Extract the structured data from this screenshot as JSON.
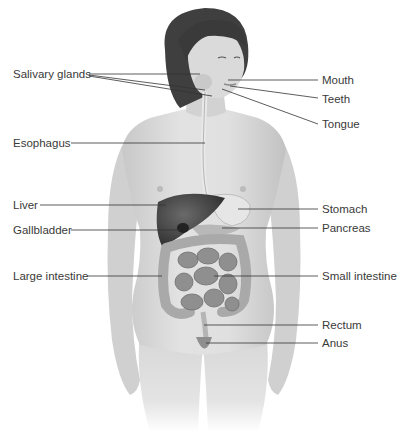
{
  "diagram": {
    "type": "anatomical-illustration",
    "colors": {
      "skin": "#d9d9d9",
      "skin_shadow": "#b5b5b5",
      "hair": "#3f3f3f",
      "liver": "#4a4a4a",
      "intestine": "#9a9a9a",
      "leader_line": "#333333",
      "label_text": "#3a3a3a"
    },
    "labels_left": [
      {
        "id": "salivary-glands",
        "text": "Salivary glands"
      },
      {
        "id": "esophagus",
        "text": "Esophagus"
      },
      {
        "id": "liver",
        "text": "Liver"
      },
      {
        "id": "gallbladder",
        "text": "Gallbladder"
      },
      {
        "id": "large-intestine",
        "text": "Large intestine"
      }
    ],
    "labels_right": [
      {
        "id": "mouth",
        "text": "Mouth"
      },
      {
        "id": "teeth",
        "text": "Teeth"
      },
      {
        "id": "tongue",
        "text": "Tongue"
      },
      {
        "id": "stomach",
        "text": "Stomach"
      },
      {
        "id": "pancreas",
        "text": "Pancreas"
      },
      {
        "id": "small-intestine",
        "text": "Small intestine"
      },
      {
        "id": "rectum",
        "text": "Rectum"
      },
      {
        "id": "anus",
        "text": "Anus"
      }
    ]
  }
}
